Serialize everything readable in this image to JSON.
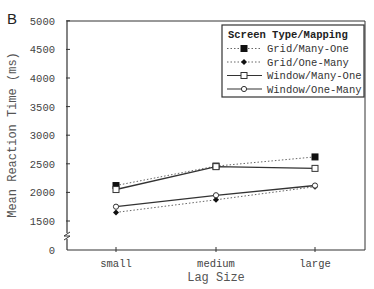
{
  "panel_label": "B",
  "chart_data": {
    "type": "line",
    "title": "",
    "xlabel": "Lag Size",
    "ylabel": "Mean Reaction Time (ms)",
    "categories": [
      "small",
      "medium",
      "large"
    ],
    "y_ticks": [
      "0",
      "1500",
      "2000",
      "2500",
      "3000",
      "3500",
      "4000",
      "4500",
      "5000"
    ],
    "ylim": [
      0,
      5000
    ],
    "axis_break": "between 0 and 1500",
    "grid": false,
    "legend_title": "Screen Type/Mapping",
    "legend_position": "upper right",
    "series": [
      {
        "name": "Grid/Many-One",
        "line": "dotted",
        "marker": "filled-square",
        "values": [
          2120,
          2460,
          2620
        ]
      },
      {
        "name": "Grid/One-Many",
        "line": "dotted",
        "marker": "filled-diamond",
        "values": [
          1650,
          1870,
          2100
        ]
      },
      {
        "name": "Window/Many-One",
        "line": "solid",
        "marker": "open-square",
        "values": [
          2050,
          2450,
          2420
        ]
      },
      {
        "name": "Window/One-Many",
        "line": "solid",
        "marker": "open-circle",
        "values": [
          1750,
          1950,
          2120
        ]
      }
    ]
  }
}
